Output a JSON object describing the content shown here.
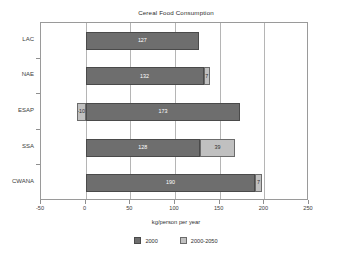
{
  "chart_data": {
    "type": "bar",
    "orientation": "horizontal",
    "stacked": true,
    "title": "Cereal Food Consumption",
    "xlabel": "kg/person per year",
    "ylabel": "",
    "categories": [
      "LAC",
      "NAE",
      "ESAP",
      "SSA",
      "CWANA"
    ],
    "series": [
      {
        "name": "2000",
        "color": "#6e6e6e",
        "values": [
          127,
          132,
          173,
          128,
          190
        ],
        "labels": [
          "127",
          "132",
          "173",
          "128",
          "190"
        ]
      },
      {
        "name": "2000-2050",
        "color": "#c0c0c0",
        "values": [
          0,
          7,
          -10,
          39,
          7
        ],
        "labels": [
          "",
          "7",
          "-10",
          "39",
          "7"
        ]
      }
    ],
    "xlim": [
      -50,
      250
    ],
    "xticks": [
      -50,
      0,
      50,
      100,
      150,
      200,
      250
    ],
    "xticklabels": [
      "-50",
      "0",
      "50",
      "100",
      "150",
      "200",
      "250"
    ],
    "grid": "vertical",
    "legend_position": "bottom",
    "legend": [
      "2000",
      "2000-2050"
    ]
  },
  "legend": {
    "items": [
      {
        "label": "2000"
      },
      {
        "label": "2000-2050"
      }
    ]
  },
  "colors": {
    "series_2000": "#6e6e6e",
    "series_2000_2050": "#c0c0c0",
    "frame": "#9a9a9a",
    "grid": "#b5b5b5",
    "background": "#ffffff"
  }
}
